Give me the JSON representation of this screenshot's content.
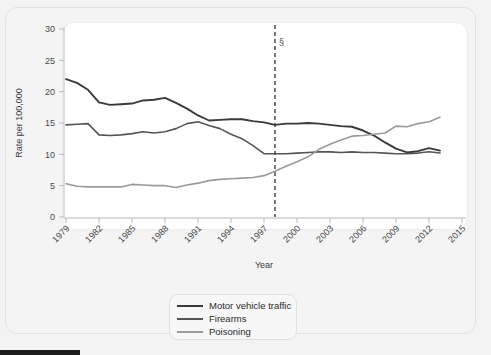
{
  "chart_data": {
    "type": "line",
    "title": "",
    "xlabel": "Year",
    "ylabel": "Rate per 100,000",
    "xlim": [
      1979,
      2015
    ],
    "ylim": [
      0,
      30
    ],
    "grid": false,
    "legend_position": "bottom-center",
    "x_ticks": [
      "1979",
      "1982",
      "1985",
      "1988",
      "1991",
      "1994",
      "1997",
      "2000",
      "2003",
      "2006",
      "2009",
      "2012",
      "2015"
    ],
    "y_ticks": [
      "0",
      "5",
      "10",
      "15",
      "20",
      "25",
      "30"
    ],
    "x": [
      1979,
      1980,
      1981,
      1982,
      1983,
      1984,
      1985,
      1986,
      1987,
      1988,
      1989,
      1990,
      1991,
      1992,
      1993,
      1994,
      1995,
      1996,
      1997,
      1998,
      1999,
      2000,
      2001,
      2002,
      2003,
      2004,
      2005,
      2006,
      2007,
      2008,
      2009,
      2010,
      2011,
      2012,
      2013
    ],
    "annotations": [
      {
        "label": "§",
        "x": 1998,
        "y": 27.5,
        "type": "vertical-dashed-line-marker"
      }
    ],
    "series": [
      {
        "name": "Motor vehicle traffic",
        "color": "#3a3a3a",
        "values": [
          22.0,
          21.4,
          20.3,
          18.3,
          17.9,
          18.0,
          18.1,
          18.6,
          18.7,
          19.0,
          18.2,
          17.3,
          16.2,
          15.4,
          15.5,
          15.6,
          15.6,
          15.3,
          15.1,
          14.7,
          14.9,
          14.9,
          15.0,
          14.9,
          14.7,
          14.5,
          14.4,
          13.8,
          13.0,
          11.9,
          10.9,
          10.3,
          10.5,
          11.0,
          10.6
        ]
      },
      {
        "name": "Firearms",
        "color": "#555555",
        "values": [
          14.7,
          14.8,
          14.9,
          13.1,
          13.0,
          13.1,
          13.3,
          13.6,
          13.4,
          13.6,
          14.1,
          14.9,
          15.2,
          14.6,
          14.1,
          13.2,
          12.5,
          11.4,
          10.1,
          10.1,
          10.1,
          10.2,
          10.3,
          10.4,
          10.4,
          10.3,
          10.4,
          10.3,
          10.3,
          10.2,
          10.1,
          10.1,
          10.2,
          10.4,
          10.2
        ]
      },
      {
        "name": "Poisoning",
        "color": "#9a9a9a",
        "values": [
          5.3,
          4.9,
          4.8,
          4.8,
          4.8,
          4.8,
          5.2,
          5.1,
          5.0,
          5.0,
          4.7,
          5.1,
          5.4,
          5.8,
          6.0,
          6.1,
          6.2,
          6.3,
          6.6,
          7.3,
          8.1,
          8.8,
          9.6,
          10.8,
          11.6,
          12.3,
          12.9,
          13.0,
          13.2,
          13.4,
          14.5,
          14.4,
          14.9,
          15.2,
          15.9
        ]
      }
    ]
  },
  "legend": {
    "items": [
      {
        "label": "Motor vehicle traffic"
      },
      {
        "label": "Firearms"
      },
      {
        "label": "Poisoning"
      }
    ]
  }
}
